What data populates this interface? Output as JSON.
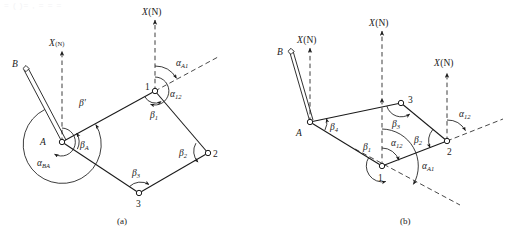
{
  "figure": {
    "title_artifact": "(  )",
    "captions": {
      "a": "(a)",
      "b": "(b)"
    },
    "axis_label": "X(N)",
    "greek": {
      "alpha": "α",
      "beta": "β",
      "beta_prime": "β′"
    }
  },
  "panel_a": {
    "caption": "(a)",
    "points": [
      {
        "name": "B",
        "label": "B",
        "marker": "diamond"
      },
      {
        "name": "A",
        "label": "A",
        "marker": "circle"
      },
      {
        "name": "station-1",
        "label": "1",
        "marker": "circle"
      },
      {
        "name": "station-2",
        "label": "2",
        "marker": "circle"
      },
      {
        "name": "station-3",
        "label": "3",
        "marker": "circle"
      }
    ],
    "axes": [
      {
        "at": "A",
        "label": "X(N)"
      },
      {
        "at": "1",
        "label": "X(N)"
      }
    ],
    "angles": [
      {
        "id": "alpha-BA",
        "base": "α",
        "sub": "BA",
        "at": "A"
      },
      {
        "id": "beta-prime",
        "base": "β′",
        "sub": "",
        "at": "A"
      },
      {
        "id": "beta-A",
        "base": "β",
        "sub": "A",
        "at": "A"
      },
      {
        "id": "alpha-A1",
        "base": "α",
        "sub": "A1",
        "at": "1"
      },
      {
        "id": "alpha-12",
        "base": "α",
        "sub": "12",
        "at": "1"
      },
      {
        "id": "beta-1",
        "base": "β",
        "sub": "1",
        "at": "1"
      },
      {
        "id": "beta-2",
        "base": "β",
        "sub": "2",
        "at": "2"
      },
      {
        "id": "beta-3",
        "base": "β",
        "sub": "3",
        "at": "3"
      }
    ]
  },
  "panel_b": {
    "caption": "(b)",
    "points": [
      {
        "name": "B",
        "label": "B",
        "marker": "diamond"
      },
      {
        "name": "A",
        "label": "A",
        "marker": "circle"
      },
      {
        "name": "station-1",
        "label": "1",
        "marker": "circle"
      },
      {
        "name": "station-2",
        "label": "2",
        "marker": "circle"
      },
      {
        "name": "station-3",
        "label": "3",
        "marker": "circle"
      }
    ],
    "axes": [
      {
        "at": "A",
        "label": "X(N)"
      },
      {
        "at": "1",
        "label": "X(N)"
      },
      {
        "at": "2",
        "label": "X(N)"
      }
    ],
    "angles": [
      {
        "id": "beta-4",
        "base": "β",
        "sub": "4",
        "at": "A"
      },
      {
        "id": "beta-3",
        "base": "β",
        "sub": "3",
        "at": "3"
      },
      {
        "id": "beta-2",
        "base": "β",
        "sub": "2",
        "at": "2"
      },
      {
        "id": "alpha-12-at-2",
        "base": "α",
        "sub": "12",
        "at": "2"
      },
      {
        "id": "beta-1",
        "base": "β",
        "sub": "1",
        "at": "1"
      },
      {
        "id": "alpha-12-at-1",
        "base": "α",
        "sub": "12",
        "at": "1"
      },
      {
        "id": "alpha-A1",
        "base": "α",
        "sub": "A1",
        "at": "1"
      }
    ]
  },
  "labels": {
    "X": "X",
    "N_paren": "(N)",
    "B": "B",
    "A": "A",
    "one": "1",
    "two": "2",
    "three": "3",
    "alpha": "α",
    "beta": "β",
    "beta_prime": "β′",
    "sub_BA": "BA",
    "sub_A": "A",
    "sub_A1": "A1",
    "sub_12": "12",
    "sub_1": "1",
    "sub_2": "2",
    "sub_3": "3",
    "sub_4": "4",
    "cap_a": "(a)",
    "cap_b": "(b)"
  },
  "colors": {
    "line": "#1a1a1a",
    "background": "#ffffff",
    "ghost_text": "#f2f2f4"
  }
}
